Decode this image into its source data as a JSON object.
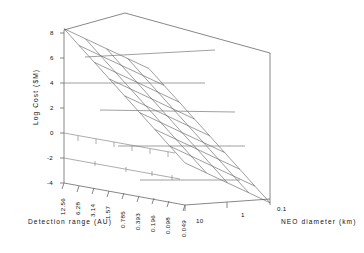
{
  "chart_data": {
    "type": "surface",
    "title": "",
    "subtitle": "",
    "zlabel": "Log Cost ($M)",
    "xlabel": "Detection range (AU)",
    "ylabel": "NEO diameter (km)",
    "zlim": [
      -4,
      8
    ],
    "z_ticks": [
      "8",
      "6",
      "4",
      "2",
      "0",
      "-2",
      "-4"
    ],
    "z_tick_values": [
      8,
      6,
      4,
      2,
      0,
      -2,
      -4
    ],
    "x_ticks": [
      "12.56",
      "6.28",
      "3.14",
      "1.57",
      "0.785",
      "0.393",
      "0.196",
      "0.098",
      "0.049"
    ],
    "x_tick_values": [
      12.56,
      6.28,
      3.14,
      1.57,
      0.785,
      0.393,
      0.196,
      0.098,
      0.049
    ],
    "y_ticks": [
      "10",
      "1",
      "0.1"
    ],
    "y_tick_values": [
      10,
      1,
      0.1
    ],
    "grid": false,
    "legend": "none",
    "mesh_color": "#555555",
    "frame_color": "#666666",
    "background": "#ffffff",
    "z_rows_by_diameter": [
      {
        "diameter": "10",
        "values": [
          8.1,
          7.0,
          5.9,
          4.8,
          3.7,
          2.6,
          1.5,
          0.4,
          -0.7
        ]
      },
      {
        "diameter": "3.16",
        "values": [
          7.2,
          6.1,
          5.0,
          3.9,
          2.8,
          1.7,
          0.6,
          -0.5,
          -1.6
        ]
      },
      {
        "diameter": "1",
        "values": [
          6.3,
          5.2,
          4.1,
          3.0,
          1.9,
          0.8,
          -0.3,
          -1.4,
          -2.5
        ]
      },
      {
        "diameter": "0.316",
        "values": [
          5.4,
          4.3,
          3.2,
          2.1,
          1.0,
          -0.1,
          -1.2,
          -2.3,
          -3.4
        ]
      },
      {
        "diameter": "0.1",
        "values": [
          4.5,
          3.4,
          2.3,
          1.2,
          0.1,
          -1.0,
          -2.1,
          -3.2,
          -4.3
        ]
      }
    ],
    "annotations": []
  }
}
